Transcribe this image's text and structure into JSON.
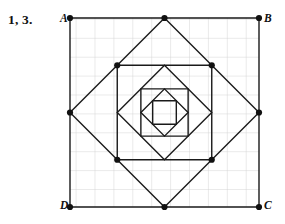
{
  "page": {
    "background_color": "#ffffff",
    "problem_label": "1, 3."
  },
  "figure": {
    "name": "nested-midpoint-squares",
    "grid": {
      "visible": true,
      "cell_size_px": 18.9,
      "line_color": "#c9c9c9",
      "columns": 10,
      "rows": 10,
      "origin_x": 70,
      "origin_y": 18,
      "width": 189,
      "height": 189
    },
    "stroke_color": "#1a1a1a",
    "stroke_width": 1.4,
    "vertex_dot_color": "#111111",
    "vertex_dot_radius": 3.1,
    "vertex_labels": [
      {
        "id": "A",
        "text": "A",
        "corner": "top-left"
      },
      {
        "id": "B",
        "text": "B",
        "corner": "top-right"
      },
      {
        "id": "C",
        "text": "C",
        "corner": "bottom-right"
      },
      {
        "id": "D",
        "text": "D",
        "corner": "bottom-left"
      }
    ],
    "shapes": [
      {
        "name": "outer-square-abcd",
        "kind": "square",
        "level": 1,
        "dots": true,
        "points": "70,18 259,18 259,207 70,207"
      },
      {
        "name": "diamond-level-2",
        "kind": "diamond",
        "level": 2,
        "dots": true,
        "points": "164.5,18 259,112.5 164.5,207 70,112.5"
      },
      {
        "name": "square-level-3",
        "kind": "square",
        "level": 3,
        "dots": true,
        "points": "117.25,65.25 211.75,65.25 211.75,159.75 117.25,159.75"
      },
      {
        "name": "diamond-level-4",
        "kind": "diamond",
        "level": 4,
        "dots": false,
        "points": "164.5,65.25 211.75,112.5 164.5,159.75 117.25,112.5"
      },
      {
        "name": "square-level-5",
        "kind": "square",
        "level": 5,
        "dots": false,
        "points": "140.875,88.875 188.125,88.875 188.125,136.125 140.875,136.125"
      },
      {
        "name": "diamond-level-6",
        "kind": "diamond",
        "level": 6,
        "dots": false,
        "points": "164.5,88.875 188.125,112.5 164.5,136.125 140.875,112.5"
      },
      {
        "name": "square-level-7",
        "kind": "square",
        "level": 7,
        "dots": false,
        "points": "152.6875,100.6875 176.3125,100.6875 176.3125,124.3125 152.6875,124.3125"
      }
    ],
    "vertex_dots": [
      {
        "name": "dot-A",
        "x": 70,
        "y": 18
      },
      {
        "name": "dot-B",
        "x": 259,
        "y": 18
      },
      {
        "name": "dot-C",
        "x": 259,
        "y": 207
      },
      {
        "name": "dot-D",
        "x": 70,
        "y": 207
      },
      {
        "name": "dot-top-mid",
        "x": 164.5,
        "y": 18
      },
      {
        "name": "dot-right-mid",
        "x": 259,
        "y": 112.5
      },
      {
        "name": "dot-bottom-mid",
        "x": 164.5,
        "y": 207
      },
      {
        "name": "dot-left-mid",
        "x": 70,
        "y": 112.5
      },
      {
        "name": "dot-inner-top-left",
        "x": 117.25,
        "y": 65.25
      },
      {
        "name": "dot-inner-top-right",
        "x": 211.75,
        "y": 65.25
      },
      {
        "name": "dot-inner-bottom-right",
        "x": 211.75,
        "y": 159.75
      },
      {
        "name": "dot-inner-bottom-left",
        "x": 117.25,
        "y": 159.75
      }
    ]
  }
}
